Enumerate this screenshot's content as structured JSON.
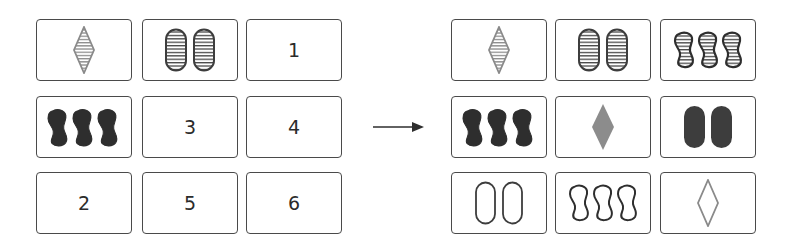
{
  "colors": {
    "card_border": "#4a4a4a",
    "dark": "#2e2e2e",
    "gray": "#8a8a8a",
    "solid_dark": "#333333",
    "solid_gray": "#8c8c8c",
    "oval_dark": "#3d3d3d"
  },
  "left_grid": {
    "cards": [
      {
        "row": 0,
        "col": 0,
        "type": "shape",
        "shape": "diamond",
        "count": 1,
        "fill": "striped",
        "color": "gray"
      },
      {
        "row": 0,
        "col": 1,
        "type": "shape",
        "shape": "oval",
        "count": 2,
        "fill": "striped",
        "color": "dark"
      },
      {
        "row": 0,
        "col": 2,
        "type": "number",
        "label": "1"
      },
      {
        "row": 1,
        "col": 0,
        "type": "shape",
        "shape": "squiggle",
        "count": 3,
        "fill": "solid",
        "color": "dark"
      },
      {
        "row": 1,
        "col": 1,
        "type": "number",
        "label": "3"
      },
      {
        "row": 1,
        "col": 2,
        "type": "number",
        "label": "4"
      },
      {
        "row": 2,
        "col": 0,
        "type": "number",
        "label": "2"
      },
      {
        "row": 2,
        "col": 1,
        "type": "number",
        "label": "5"
      },
      {
        "row": 2,
        "col": 2,
        "type": "number",
        "label": "6"
      }
    ],
    "labels": {
      "c02": "1",
      "c11": "3",
      "c12": "4",
      "c20": "2",
      "c21": "5",
      "c22": "6"
    }
  },
  "arrow": {
    "icon": "right-arrow-icon",
    "direction": "right"
  },
  "right_grid": {
    "cards": [
      {
        "row": 0,
        "col": 0,
        "shape": "diamond",
        "count": 1,
        "fill": "striped",
        "color": "gray"
      },
      {
        "row": 0,
        "col": 1,
        "shape": "oval",
        "count": 2,
        "fill": "striped",
        "color": "dark"
      },
      {
        "row": 0,
        "col": 2,
        "shape": "squiggle",
        "count": 3,
        "fill": "striped",
        "color": "dark"
      },
      {
        "row": 1,
        "col": 0,
        "shape": "squiggle",
        "count": 3,
        "fill": "solid",
        "color": "dark"
      },
      {
        "row": 1,
        "col": 1,
        "shape": "diamond",
        "count": 1,
        "fill": "solid",
        "color": "gray"
      },
      {
        "row": 1,
        "col": 2,
        "shape": "oval",
        "count": 2,
        "fill": "solid",
        "color": "dark"
      },
      {
        "row": 2,
        "col": 0,
        "shape": "oval",
        "count": 2,
        "fill": "outline",
        "color": "dark"
      },
      {
        "row": 2,
        "col": 1,
        "shape": "squiggle",
        "count": 3,
        "fill": "outline",
        "color": "dark"
      },
      {
        "row": 2,
        "col": 2,
        "shape": "diamond",
        "count": 1,
        "fill": "outline",
        "color": "gray"
      }
    ]
  }
}
